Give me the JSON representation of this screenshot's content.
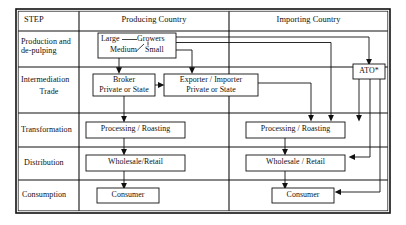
{
  "figure": {
    "type": "flow-diagram"
  },
  "table": {
    "columns": [
      {
        "key": "step",
        "label": "STEP"
      },
      {
        "key": "producing",
        "label": "Producing Country"
      },
      {
        "key": "importing",
        "label": "Importing Country"
      }
    ],
    "rows": [
      {
        "step": "Production and",
        "step_line2": "de-pulping"
      },
      {
        "step": "Intermediation",
        "step_line2": "Trade"
      },
      {
        "step": "Transformation",
        "step_line2": ""
      },
      {
        "step": "Distribution",
        "step_line2": ""
      },
      {
        "step": "Consumption",
        "step_line2": ""
      }
    ]
  },
  "nodes": {
    "growers": {
      "large": "Large",
      "growers": "Growers",
      "medium": "Medium",
      "small": "Small"
    },
    "broker": {
      "line1": "Broker",
      "line2": "Private or State"
    },
    "exporter": {
      "line1": "Exporter / Importer",
      "line2": "Private or State"
    },
    "ato": {
      "label": "ATO*"
    },
    "processing_producing": {
      "label": "Processing / Roasting"
    },
    "processing_importing": {
      "label": "Processing / Roasting"
    },
    "wholesale_producing": {
      "label": "Wholesale/Retail"
    },
    "wholesale_importing": {
      "label": "Wholesale / Retail"
    },
    "consumer_producing": {
      "label": "Consumer"
    },
    "consumer_importing": {
      "label": "Consumer"
    }
  },
  "colors": {
    "line": "#111111",
    "background": "#ffffff",
    "text": "#111111"
  }
}
